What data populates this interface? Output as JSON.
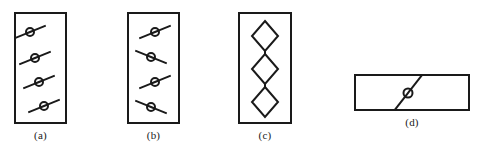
{
  "figure": {
    "title": "",
    "background_color": "#ffffff",
    "ink_color": "#1a1a1a",
    "width": 479,
    "height": 153,
    "panel_count": 4
  },
  "panels": [
    {
      "id": "a",
      "label": "(a)",
      "shape": "tall-rectangle",
      "frame": {
        "x": 14,
        "y": 12,
        "width": 53,
        "height": 112
      },
      "element_type": "circle-with-diagonal-line",
      "element_count": 4,
      "arrangement": "vertical-stack-offset-right",
      "description": "Four circles each crossed by a line rising to the right, staggered downward and to the right",
      "elements": [
        {
          "cx": 16,
          "cy": 20,
          "r": 4.0,
          "angle_deg": -22,
          "line_half_length": 17
        },
        {
          "cx": 21,
          "cy": 46,
          "r": 4.0,
          "angle_deg": -22,
          "line_half_length": 17
        },
        {
          "cx": 25,
          "cy": 70,
          "r": 4.0,
          "angle_deg": -22,
          "line_half_length": 17
        },
        {
          "cx": 30,
          "cy": 94,
          "r": 4.0,
          "angle_deg": -22,
          "line_half_length": 17
        }
      ]
    },
    {
      "id": "b",
      "label": "(b)",
      "shape": "tall-rectangle",
      "frame": {
        "x": 127,
        "y": 12,
        "width": 53,
        "height": 112
      },
      "element_type": "circle-with-diagonal-line",
      "element_count": 4,
      "arrangement": "vertical-stack-alternating-slope",
      "description": "Four circles each crossed by a line, slopes alternating between rising and falling to the right",
      "elements": [
        {
          "cx": 28,
          "cy": 20,
          "r": 4.0,
          "angle_deg": -22,
          "line_half_length": 17
        },
        {
          "cx": 24,
          "cy": 45,
          "r": 4.0,
          "angle_deg": 22,
          "line_half_length": 17
        },
        {
          "cx": 28,
          "cy": 70,
          "r": 4.0,
          "angle_deg": -22,
          "line_half_length": 17
        },
        {
          "cx": 24,
          "cy": 95,
          "r": 4.0,
          "angle_deg": 22,
          "line_half_length": 17
        }
      ]
    },
    {
      "id": "c",
      "label": "(c)",
      "shape": "tall-rectangle",
      "frame": {
        "x": 238,
        "y": 12,
        "width": 54,
        "height": 112
      },
      "element_type": "diamond-chain",
      "element_count": 3,
      "arrangement": "vertical-chain-linked",
      "description": "Three diamonds stacked vertically and joined by short vertical connecting segments",
      "elements": [
        {
          "cx": 27,
          "cy": 24,
          "half_width": 13,
          "half_height": 15
        },
        {
          "cx": 27,
          "cy": 57,
          "half_width": 13,
          "half_height": 15
        },
        {
          "cx": 27,
          "cy": 90,
          "half_width": 13,
          "half_height": 15
        }
      ],
      "connectors": [
        {
          "x": 27,
          "y1": 39,
          "y2": 42
        },
        {
          "x": 27,
          "y1": 72,
          "y2": 75
        }
      ]
    },
    {
      "id": "d",
      "label": "(d)",
      "shape": "wide-rectangle",
      "frame": {
        "x": 354,
        "y": 74,
        "width": 116,
        "height": 37
      },
      "element_type": "circle-with-diagonal-line",
      "element_count": 1,
      "arrangement": "single-centered",
      "description": "One circle crossed by a steeply rising diagonal line at the centre of a wide rectangle",
      "elements": [
        {
          "cx": 54,
          "cy": 19,
          "r": 4.5,
          "angle_deg": -52,
          "line_half_length": 23
        }
      ]
    }
  ],
  "style": {
    "frame_stroke_width": 2,
    "element_stroke_width": 2,
    "label_font_size_px": 11
  }
}
